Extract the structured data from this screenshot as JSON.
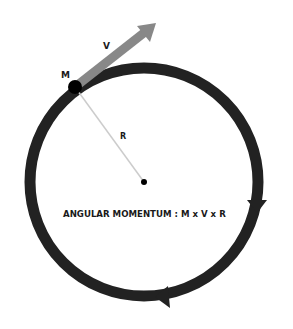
{
  "diagram": {
    "labels": {
      "mass": "M",
      "velocity": "V",
      "radius": "R",
      "formula": "ANGULAR MOMENTUM : M x V x R"
    },
    "colors": {
      "orbit": "#222222",
      "velocity_arrow": "#888888",
      "radius_line": "#cccccc",
      "mass": "#000000",
      "background": "#ffffff"
    },
    "geometry": {
      "center": [
        144,
        182
      ],
      "orbit_radius": 114,
      "orbit_stroke": 11,
      "mass_position": [
        75,
        87
      ],
      "velocity_tip": [
        156,
        23
      ],
      "direction": "clockwise"
    }
  }
}
